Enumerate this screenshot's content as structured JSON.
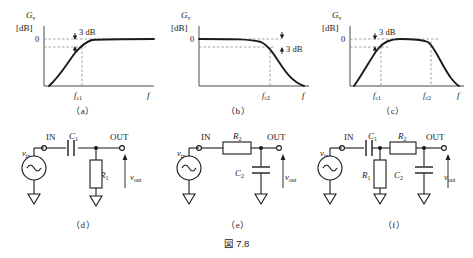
{
  "caption": "図 7.8",
  "axis": {
    "gain_symbol": "G",
    "gain_subscript": "v",
    "gain_unit": "[dB]",
    "zero_label": "0",
    "freq_symbol": "f",
    "fc1_label": "f",
    "fc1_sub": "c1",
    "fc2_label": "f",
    "fc2_sub": "c2",
    "drop_label": "3 dB"
  },
  "plots": [
    {
      "id": "a",
      "panel_label": "（a）",
      "name": "high-pass-response",
      "type": "line",
      "title": "",
      "xlabel": "f",
      "ylabel": "Gv [dB]",
      "annotation": "3 dB",
      "annotation_side": "left",
      "ticks": [
        "f c1"
      ],
      "description": "high-pass: rises from low gain, knee at fc1, flat at 0 dB",
      "chart_points": [
        [
          0.0,
          -26
        ],
        [
          0.06,
          -24
        ],
        [
          0.14,
          -18
        ],
        [
          0.22,
          -12.5
        ],
        [
          0.3,
          -8
        ],
        [
          0.38,
          -4.5
        ],
        [
          0.44,
          -2.6
        ],
        [
          0.5,
          -1.2
        ],
        [
          0.56,
          -0.5
        ],
        [
          0.64,
          -0.15
        ],
        [
          0.74,
          -0.03
        ],
        [
          1.0,
          0
        ]
      ],
      "cutoff_x": 0.44,
      "cutoff_y": -3
    },
    {
      "id": "b",
      "panel_label": "（b）",
      "name": "low-pass-response",
      "type": "line",
      "title": "",
      "xlabel": "f",
      "ylabel": "Gv [dB]",
      "annotation": "3 dB",
      "annotation_side": "right",
      "ticks": [
        "f c2"
      ],
      "description": "low-pass: flat at 0 dB, knee at fc2, falls off",
      "chart_points": [
        [
          0.0,
          0
        ],
        [
          0.3,
          0
        ],
        [
          0.46,
          -0.05
        ],
        [
          0.56,
          -0.2
        ],
        [
          0.64,
          -0.7
        ],
        [
          0.7,
          -1.7
        ],
        [
          0.745,
          -3
        ],
        [
          0.8,
          -6
        ],
        [
          0.86,
          -11
        ],
        [
          0.92,
          -17
        ],
        [
          0.97,
          -23
        ],
        [
          1.0,
          -26
        ]
      ],
      "cutoff_x": 0.745,
      "cutoff_y": -3
    },
    {
      "id": "c",
      "panel_label": "（c）",
      "name": "band-pass-response",
      "type": "line",
      "title": "",
      "xlabel": "f",
      "ylabel": "Gv [dB]",
      "annotation": "3 dB",
      "annotation_side": "left",
      "ticks": [
        "f c1",
        "f c2"
      ],
      "description": "band-pass: rises to 0 dB between fc1 and fc2, then falls",
      "chart_points": [
        [
          0.02,
          -26
        ],
        [
          0.1,
          -20
        ],
        [
          0.18,
          -14
        ],
        [
          0.26,
          -8.5
        ],
        [
          0.32,
          -5
        ],
        [
          0.37,
          -2.6
        ],
        [
          0.42,
          -1.0
        ],
        [
          0.48,
          -0.25
        ],
        [
          0.56,
          -0.02
        ],
        [
          0.66,
          0
        ],
        [
          0.72,
          -0.05
        ],
        [
          0.77,
          -0.3
        ],
        [
          0.82,
          -1.2
        ],
        [
          0.87,
          -3.2
        ],
        [
          0.92,
          -8
        ],
        [
          0.96,
          -15
        ],
        [
          1.0,
          -26
        ]
      ],
      "cutoff_x": 0.37,
      "cutoff_y": -3,
      "cutoff2_x": 0.795,
      "cutoff2_y": -3
    }
  ],
  "circuits": [
    {
      "id": "d",
      "panel_label": "（d）",
      "name": "high-pass-rc-circuit",
      "in_label": "IN",
      "out_label": "OUT",
      "source_label": "v",
      "source_sub": "in",
      "out_voltage_label": "v",
      "out_voltage_sub": "out",
      "components": [
        {
          "ref": "C",
          "sub": "1",
          "type": "capacitor",
          "position": "series"
        },
        {
          "ref": "R",
          "sub": "1",
          "type": "resistor",
          "position": "shunt"
        }
      ]
    },
    {
      "id": "e",
      "panel_label": "（e）",
      "name": "low-pass-rc-circuit",
      "in_label": "IN",
      "out_label": "OUT",
      "source_label": "v",
      "source_sub": "in",
      "out_voltage_label": "v",
      "out_voltage_sub": "out",
      "components": [
        {
          "ref": "R",
          "sub": "2",
          "type": "resistor",
          "position": "series"
        },
        {
          "ref": "C",
          "sub": "2",
          "type": "capacitor",
          "position": "shunt"
        }
      ]
    },
    {
      "id": "f",
      "panel_label": "（f）",
      "name": "band-pass-rc-circuit",
      "in_label": "IN",
      "out_label": "OUT",
      "source_label": "v",
      "source_sub": "in",
      "out_voltage_label": "v",
      "out_voltage_sub": "out",
      "components": [
        {
          "ref": "C",
          "sub": "1",
          "type": "capacitor",
          "position": "series"
        },
        {
          "ref": "R",
          "sub": "1",
          "type": "resistor",
          "position": "shunt"
        },
        {
          "ref": "R",
          "sub": "2",
          "type": "resistor",
          "position": "series"
        },
        {
          "ref": "C",
          "sub": "2",
          "type": "capacitor",
          "position": "shunt"
        }
      ]
    }
  ]
}
